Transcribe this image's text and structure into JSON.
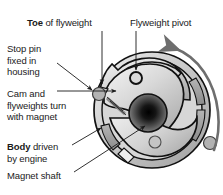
{
  "figure": {
    "type": "mechanical-cutaway-diagram",
    "background_color": "#ffffff",
    "outline_color": "#111111"
  },
  "labels": {
    "toe": {
      "bold_word": "Toe",
      "rest": " of flyweight"
    },
    "pivot": {
      "text": "Flyweight pivot"
    },
    "stop_pin": {
      "line1": "Stop pin",
      "line2": "fixed in",
      "line3": "housing"
    },
    "cam": {
      "line1": "Cam and",
      "line2": "flyweights turn",
      "line3": "with magnet"
    },
    "body": {
      "bold_word": "Body",
      "rest": " driven",
      "line2": "by engine"
    },
    "magnet_shaft": {
      "text": "Magnet shaft"
    }
  },
  "parts": {
    "body_ring": {
      "name": "Body driven by engine",
      "fill_light": "#e8e8e8",
      "fill_mid": "#bdbdbd",
      "fill_dark": "#8f8f8f"
    },
    "flyweight_upper": {
      "name": "Upper flyweight",
      "fill": "#d2d2d2"
    },
    "flyweight_lower": {
      "name": "Lower flyweight",
      "fill": "#cfcfcf"
    },
    "magnet_shaft_hub": {
      "name": "Magnet shaft",
      "fill_center": "#0d0d0d",
      "fill_edge": "#8a8a8a"
    },
    "pivot_ring": {
      "name": "Flyweight pivot ring",
      "fill": "#d8d8d8",
      "stroke": "#111111"
    },
    "stop_pin_left": {
      "name": "Stop pin fixed in housing (left)",
      "fill": "#b0b0b0"
    },
    "stop_pin_right": {
      "name": "Stop pin (right)",
      "fill": "#b0b0b0"
    },
    "secondary_pivot": {
      "name": "Lower pivot boss",
      "fill": "#c4c4c4"
    },
    "rotation_arrow": {
      "name": "Direction of rotation",
      "direction": "counter-clockwise",
      "color": "#6b6b6b"
    }
  },
  "leaders": {
    "toe_leader": "vertical line from Toe label down to toe of upper flyweight",
    "pivot_leader": "vertical line from Flyweight pivot label down to pivot ring",
    "stop_pin_leader": "diagonal arrow to left stop pin",
    "cam_leader": "horizontal line with small arrowhead into cam slot",
    "body_leader": "diagonal arrow to outer body ring",
    "magnet_leader": "diagonal line up to central magnet shaft"
  }
}
